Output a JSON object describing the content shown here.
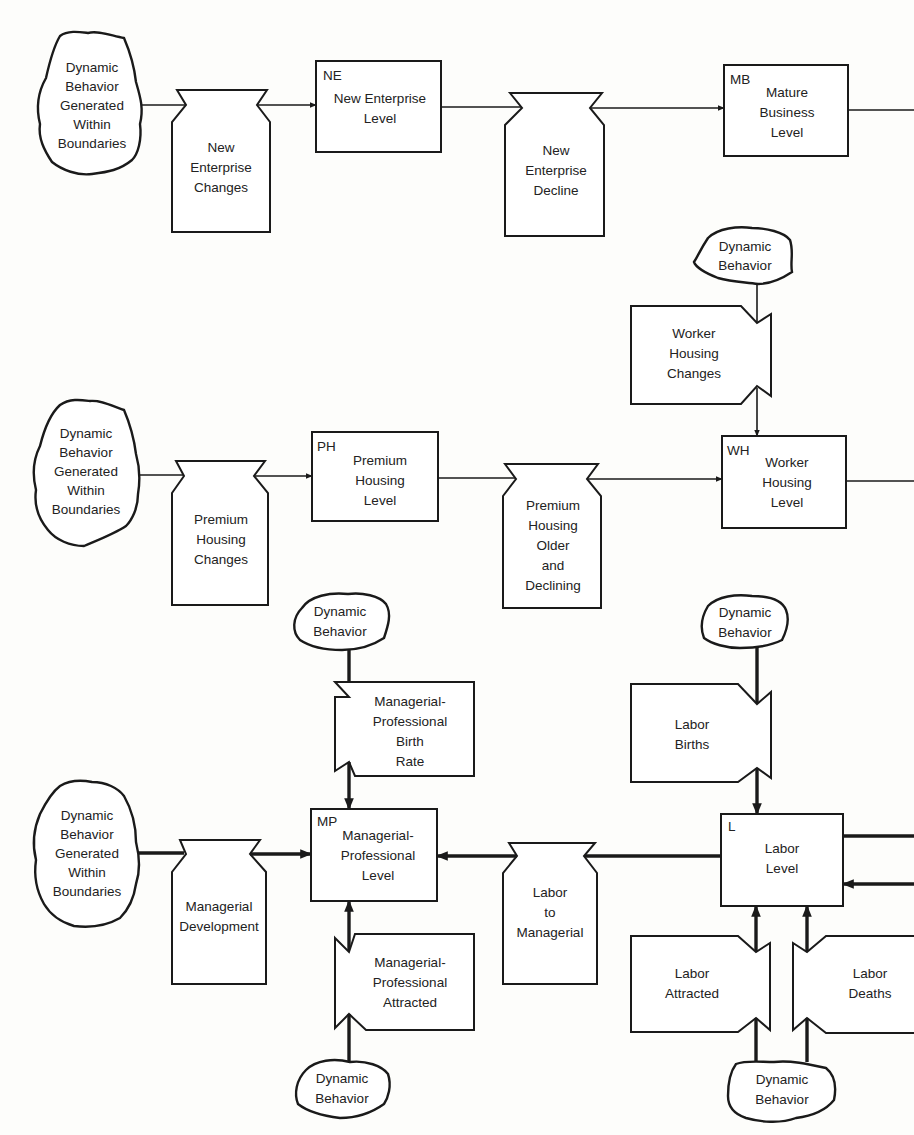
{
  "title_fragment": "ynamic Behavior Generated Within Boundary",
  "sources": {
    "src1": [
      "Dynamic",
      "Behavior",
      "Generated",
      "Within",
      "Boundaries"
    ],
    "src2": [
      "Dynamic",
      "Behavior",
      "Generated",
      "Within",
      "Boundaries"
    ],
    "src3": [
      "Dynamic",
      "Behavior",
      "Generated",
      "Within",
      "Boundaries"
    ],
    "db_wh": [
      "Dynamic",
      "Behavior"
    ],
    "db_mp_top": [
      "Dynamic",
      "Behavior"
    ],
    "db_mp_bottom": [
      "Dynamic",
      "Behavior"
    ],
    "db_l_top": [
      "Dynamic",
      "Behavior"
    ],
    "db_l_bottom": [
      "Dynamic",
      "Behavior"
    ]
  },
  "levels": {
    "ne": {
      "tag": "NE",
      "lines": [
        "New Enterprise",
        "Level"
      ]
    },
    "mb": {
      "tag": "MB",
      "lines": [
        "Mature",
        "Business",
        "Level"
      ]
    },
    "ph": {
      "tag": "PH",
      "lines": [
        "Premium",
        "Housing",
        "Level"
      ]
    },
    "wh": {
      "tag": "WH",
      "lines": [
        "Worker",
        "Housing",
        "Level"
      ]
    },
    "mp": {
      "tag": "MP",
      "lines": [
        "Managerial-",
        "Professional",
        "Level"
      ]
    },
    "l": {
      "tag": "L",
      "lines": [
        "Labor",
        "Level"
      ]
    }
  },
  "rates": {
    "nec": [
      "New",
      "Enterprise",
      "Changes"
    ],
    "ned": [
      "New",
      "Enterprise",
      "Decline"
    ],
    "whc": [
      "Worker",
      "Housing",
      "Changes"
    ],
    "phc": [
      "Premium",
      "Housing",
      "Changes"
    ],
    "phd": [
      "Premium",
      "Housing",
      "Older",
      "and",
      "Declining"
    ],
    "mpb": [
      "Managerial-",
      "Professional",
      "Birth",
      "Rate"
    ],
    "md": [
      "Managerial",
      "Development"
    ],
    "ltm": [
      "Labor",
      "to",
      "Managerial"
    ],
    "mpa": [
      "Managerial-",
      "Professional",
      "Attracted"
    ],
    "lb": [
      "Labor",
      "Births"
    ],
    "la": [
      "Labor",
      "Attracted"
    ],
    "ld": [
      "Labor",
      "Deaths"
    ]
  }
}
